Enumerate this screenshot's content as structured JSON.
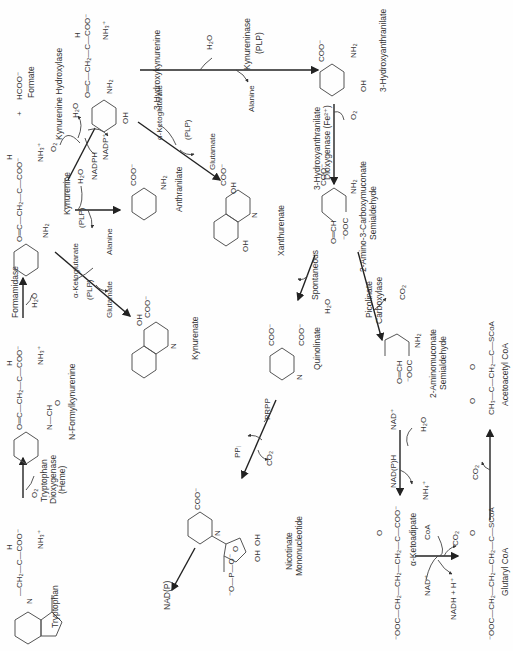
{
  "diagram": {
    "orientation": "rotated 90 degrees clockwise; text reads bottom-to-top",
    "compounds": [
      {
        "id": "tryptophan",
        "label": "Tryptophan",
        "groups": [
          "CH2",
          "H",
          "C",
          "COO⁻",
          "NH3⁺",
          "N"
        ]
      },
      {
        "id": "n_formylkynurenine",
        "label": "N-Formylkynurenine",
        "groups": [
          "O",
          "C",
          "CH2",
          "H",
          "C",
          "COO⁻",
          "NH3⁺",
          "N",
          "H",
          "CH",
          "O"
        ]
      },
      {
        "id": "formate",
        "label": "Formate",
        "formula": "HCOO⁻",
        "plus": "+"
      },
      {
        "id": "kynurenine",
        "label": "Kynurenine",
        "groups": [
          "O",
          "C",
          "CH2",
          "H",
          "C",
          "COO⁻",
          "NH3⁺",
          "NH2"
        ]
      },
      {
        "id": "hydroxykynurenine",
        "label": "3-Hydroxykynurenine",
        "groups": [
          "O",
          "C",
          "CH2",
          "H",
          "C",
          "COO⁻",
          "NH3⁺",
          "NH2",
          "OH"
        ]
      },
      {
        "id": "anthranilate",
        "label": "Anthranilate",
        "groups": [
          "COO⁻",
          "NH2"
        ]
      },
      {
        "id": "kynurenate",
        "label": "Kynurenate",
        "groups": [
          "OH",
          "COO⁻",
          "N"
        ]
      },
      {
        "id": "xanthurenate",
        "label": "Xanthurenate",
        "groups": [
          "OH",
          "COO⁻",
          "N",
          "OH"
        ]
      },
      {
        "id": "hydroxyanthranilate",
        "label": "3-Hydroxyanthranilate",
        "groups": [
          "COO⁻",
          "NH2",
          "OH"
        ]
      },
      {
        "id": "acms",
        "label": "2-Amino-3-Carboxymuconate Semialdehyde",
        "groups": [
          "COO⁻",
          "NH2",
          "O=CH",
          "⁻OOC"
        ]
      },
      {
        "id": "aminomuconate",
        "label": "2-Aminomuconate Semialdehyde",
        "groups": [
          "NH2",
          "O=CH",
          "⁻OOC"
        ]
      },
      {
        "id": "quinolinate",
        "label": "Quinolinate",
        "groups": [
          "COO⁻",
          "COO⁻",
          "N"
        ]
      },
      {
        "id": "nicotinate_mononucleotide",
        "label": "Nicotinate Mononucleotide",
        "groups": [
          "COO⁻",
          "N⁺",
          "O",
          "OH",
          "OH",
          "O",
          "P",
          "O",
          "O⁻",
          "O⁻"
        ]
      },
      {
        "id": "alpha_ketoadipate",
        "label": "α-Ketoadipate",
        "formula": "⁻OOC—CH2—CH2—CH2—C(=O)—COO⁻"
      },
      {
        "id": "glutaryl_coa",
        "label": "Glutaryl CoA",
        "formula": "⁻OOC—CH2—CH2—CH2—C(=O)—SCoA"
      },
      {
        "id": "acetoacetyl_coa",
        "label": "Acetoacetyl CoA",
        "formula": "CH3—C(=O)—CH2—C(=O)—SCoA"
      }
    ],
    "enzymes": [
      {
        "id": "trp_dioxygenase",
        "label": "Tryptophan Dioxygenase (Heme)",
        "cofactor": "O2"
      },
      {
        "id": "formamidase",
        "label": "Formamidase",
        "cofactor": "H2O"
      },
      {
        "id": "kyn_hydroxylase",
        "label": "Kynurenine Hydroxylase",
        "inputs": [
          "O2",
          "NADPH"
        ],
        "outputs": [
          "H2O",
          "NADP⁺"
        ]
      },
      {
        "id": "kynureninase_1",
        "label": "Kynureninase",
        "cofactor": "(PLP)",
        "inputs": [
          "H2O"
        ],
        "outputs": [
          "Alanine"
        ]
      },
      {
        "id": "kynureninase_2",
        "label": "Kynureninase (PLP)",
        "inputs": [
          "H2O"
        ],
        "outputs": [
          "Alanine"
        ]
      },
      {
        "id": "transaminase_1",
        "cofactor": "(PLP)",
        "inputs": [
          "α-Ketoglutarate"
        ],
        "outputs": [
          "Glutamate"
        ]
      },
      {
        "id": "transaminase_2",
        "cofactor": "(PLP)",
        "inputs": [
          "α-Ketoglutarate"
        ],
        "outputs": [
          "Glutamate"
        ]
      },
      {
        "id": "haa_dioxygenase",
        "label": "3-Hydroxyanthranilate Dioxygenase (Fe²⁺)",
        "inputs": [
          "O2"
        ]
      },
      {
        "id": "picolinate_carboxylase",
        "label": "Picolinate Carboxylase",
        "outputs": [
          "CO2"
        ]
      },
      {
        "id": "spontaneous",
        "label": "Spontaneous",
        "outputs": [
          "H2O"
        ]
      },
      {
        "id": "qprt",
        "inputs": [
          "PRPP"
        ],
        "outputs": [
          "PPi",
          "CO2"
        ]
      },
      {
        "id": "nad_branch",
        "outputs": [
          "NAD(P)"
        ]
      },
      {
        "id": "semialdehyde_dh",
        "inputs": [
          "NAD⁺",
          "H2O"
        ],
        "outputs": [
          "NAD(P)H",
          "NH4⁺"
        ]
      },
      {
        "id": "ketoadipate_dh",
        "inputs": [
          "NAD⁺",
          "CoA"
        ],
        "outputs": [
          "NADH + H⁺",
          "CO2"
        ]
      },
      {
        "id": "glutaryl_step",
        "outputs": [
          "CO2"
        ]
      }
    ]
  },
  "text": {
    "tryptophan": "Tryptophan",
    "trp_dioxygenase_1": "Tryptophan",
    "trp_dioxygenase_2": "Dioxygenase",
    "trp_dioxygenase_3": "(Heme)",
    "o2": "O₂",
    "nfk": "N-Formylkynurenine",
    "formamidase": "Formamidase",
    "h2o": "H₂O",
    "formate": "Formate",
    "hcoo": "HCOO⁻",
    "plus": "+",
    "kynurenine": "Kynurenine",
    "kyn_hydroxylase": "Kynurenine Hydroxylase",
    "nadph": "NADPH",
    "nadp": "NADP⁺",
    "hydroxykynurenine": "3-Hydroxykynurenine",
    "plp": "(PLP)",
    "alanine": "Alanine",
    "anthranilate": "Anthranilate",
    "akg": "α-Ketoglutarate",
    "glutamate": "Glutamate",
    "kynurenate": "Kynurenate",
    "xanthurenate": "Xanthurenate",
    "kynureninase": "Kynureninase",
    "hydroxyanthranilate": "3-Hydroxyanthranilate",
    "haa_diox_1": "3-Hydroxyanthranilate",
    "haa_diox_2": "Dioxygenase (Fe²⁺)",
    "acms_1": "2-Amino-3-Carboxymuconate",
    "acms_2": "Semialdehyde",
    "picolinate_1": "Picolinate",
    "picolinate_2": "Carboxylase",
    "co2": "CO₂",
    "spontaneous": "Spontaneous",
    "quinolinate": "Quinolinate",
    "prpp": "PRPP",
    "ppi": "PPᵢ",
    "nadp_paren": "NAD(P)",
    "nmn_1": "Nicotinate",
    "nmn_2": "Mononucleotide",
    "aminomuconate_1": "2-Aminomuconate",
    "aminomuconate_2": "Semialdehyde",
    "nad_plus": "NAD⁺",
    "nadph_paren": "NAD(P)H",
    "nh4": "NH₄⁺",
    "ketoadipate": "α-Ketoadipate",
    "coa": "CoA",
    "nadh_h": "NADH + H⁺",
    "glutaryl_coa": "Glutaryl CoA",
    "acetoacetyl_coa": "Acetoacetyl CoA",
    "ketoadipate_formula": "⁻OOC—CH₂—CH₂—CH₂—C—COO⁻",
    "glutaryl_formula": "⁻OOC—CH₂—CH₂—CH₂—C—SCoA",
    "acetoacetyl_formula": "CH₃—C—CH₂—C—SCoA",
    "side_chain": "—CH₂—C—COO⁻",
    "side_chain_ketone": "O═C—CH₂—C—COO⁻",
    "h": "H",
    "nh3": "NH₃⁺",
    "nh2": "NH₂",
    "oh": "OH",
    "coo": "COO⁻",
    "n": "N",
    "o_eq": "O",
    "formyl": "N—CH",
    "ooc": "⁻OOC",
    "och": "O═CH",
    "phosphate": "⁻O—P—O⁻"
  }
}
